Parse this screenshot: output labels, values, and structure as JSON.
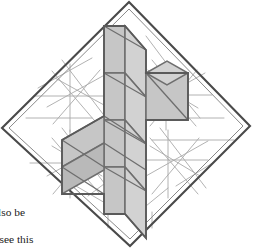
{
  "figure": {
    "colors": {
      "background": "#ffffff",
      "frame_stroke": "#4a4a4a",
      "construction_line": "#a9a9a9",
      "face_fill_light": "#d2d2d2",
      "face_fill_mid": "#c6c6c6",
      "face_fill_dark": "#b9b9b9",
      "face_stroke": "#6e6e6e",
      "text": "#1a1a1a"
    },
    "frame": {
      "shape": "rotated-square",
      "outer_points": "129,2 250,126 130,246 2,128",
      "inner_points": "129,9 243,126 130,239 9,128"
    },
    "cross": {
      "description": "Six-armed isometric cross built of rhombi: tall vertical column crossed by a horizontal band of rhombi",
      "cell_count": 14
    },
    "construction_star_count": 4
  },
  "caption": {
    "lines": [
      "also be",
      "",
      "n see this"
    ],
    "line_1": "also be",
    "line_2": "",
    "line_3": "n see this"
  }
}
